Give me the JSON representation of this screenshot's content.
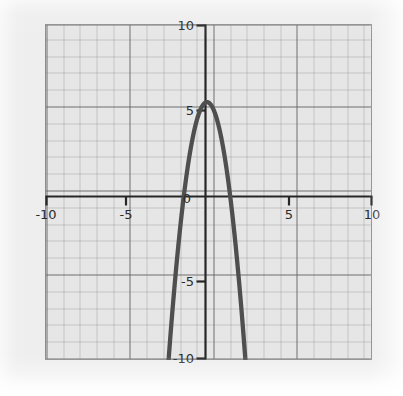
{
  "chart_data": {
    "type": "line",
    "title": "",
    "subtitle": "",
    "xlabel": "",
    "ylabel": "",
    "xlim": [
      -10,
      10
    ],
    "ylim": [
      -10,
      10
    ],
    "grid": true,
    "grid_major_step": 5,
    "grid_minor_step": 1,
    "legend": "none",
    "axis_style": "centered-cross",
    "x_tick_labels": [
      "-10",
      "-5",
      "0",
      "5",
      "10"
    ],
    "x_tick_values": [
      -10,
      -5,
      0,
      5,
      10
    ],
    "y_tick_labels": [
      "10",
      "5",
      "-5",
      "-10"
    ],
    "y_tick_values": [
      10,
      5,
      -5,
      -10
    ],
    "curve_color": "#4f4f4f",
    "axis_color": "#262626",
    "grid_color": "#8c8c8c",
    "plot_background": "#e6e6e6",
    "page_background": "#eeeeee",
    "series": [
      {
        "name": "parabola",
        "equation": "y = -2.8x^2 + 0.5x + 5.5",
        "vertex": [
          0.09,
          5.52
        ],
        "x_intercepts": [
          -1.32,
          1.49
        ],
        "y_intercept": 5.5,
        "x": [
          -1.75,
          -1.6,
          -1.4,
          -1.2,
          -1.0,
          -0.8,
          -0.6,
          -0.4,
          -0.2,
          0.0,
          0.2,
          0.4,
          0.6,
          0.8,
          1.0,
          1.2,
          1.4,
          1.6,
          1.8,
          2.0,
          2.1
        ],
        "y": [
          -10.0,
          -8.87,
          -6.69,
          -4.14,
          -2.3,
          -0.69,
          0.19,
          4.85,
          5.29,
          5.5,
          5.49,
          5.25,
          4.79,
          4.11,
          3.2,
          2.07,
          0.72,
          -0.85,
          -2.58,
          -4.7,
          -5.8
        ]
      }
    ],
    "series_points": [
      {
        "x": -1.77,
        "y": -10.0
      },
      {
        "x": -1.6,
        "y": -8.07
      },
      {
        "x": -1.4,
        "y": -0.69
      },
      {
        "x": -1.32,
        "y": 0.0
      },
      {
        "x": -1.0,
        "y": 2.2
      },
      {
        "x": -0.7,
        "y": 3.78
      },
      {
        "x": -0.4,
        "y": 4.85
      },
      {
        "x": -0.1,
        "y": 5.42
      },
      {
        "x": 0.09,
        "y": 5.52
      },
      {
        "x": 0.4,
        "y": 5.25
      },
      {
        "x": 0.7,
        "y": 4.48
      },
      {
        "x": 1.0,
        "y": 3.2
      },
      {
        "x": 1.3,
        "y": 1.42
      },
      {
        "x": 1.49,
        "y": 0.0
      },
      {
        "x": 1.8,
        "y": -2.68
      },
      {
        "x": 2.1,
        "y": -5.85
      },
      {
        "x": 2.55,
        "y": -10.0
      }
    ]
  },
  "axes": {
    "x_ticks": [
      {
        "label": "-10",
        "value": -10
      },
      {
        "label": "-5",
        "value": -5
      },
      {
        "label": "0",
        "value": 0
      },
      {
        "label": "5",
        "value": 5
      },
      {
        "label": "10",
        "value": 10
      }
    ],
    "y_ticks": [
      {
        "label": "10",
        "value": 10
      },
      {
        "label": "5",
        "value": 5
      },
      {
        "label": "-5",
        "value": -5
      },
      {
        "label": "-10",
        "value": -10
      }
    ]
  }
}
